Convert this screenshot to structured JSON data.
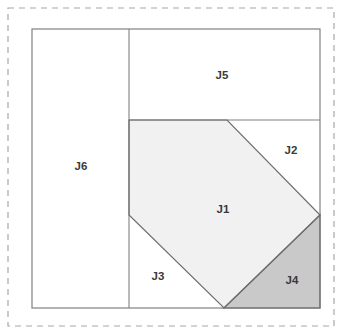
{
  "figure": {
    "canvas": {
      "width": 342,
      "height": 334,
      "background": "#ffffff"
    },
    "outer_dashed_frame": {
      "x": 8,
      "y": 8,
      "width": 326,
      "height": 318,
      "stroke": "#a8a8a8",
      "dash": "6 5"
    },
    "outer_square": {
      "x": 32,
      "y": 29,
      "width": 288,
      "height": 279,
      "stroke": "#808080",
      "fill": "#ffffff"
    },
    "colors": {
      "line": "#808080",
      "diagonal_line": "#6e6e6e",
      "label_text": "#3a3a3a",
      "fill_white": "#ffffff",
      "fill_light_gray": "#f1f1f1",
      "fill_medium_gray": "#c9c9c9",
      "dashed_frame": "#a8a8a8"
    },
    "dividers": [
      {
        "name": "vertical-divider",
        "x1": 129,
        "y1": 29,
        "x2": 129,
        "y2": 308
      },
      {
        "name": "horizontal-divider",
        "x1": 129,
        "y1": 120,
        "x2": 320,
        "y2": 120
      }
    ],
    "regions": [
      {
        "id": "J1",
        "label": "J1",
        "shape": "pentagon",
        "points": "129,120 227,120 320,215 224,308 129,215",
        "fill": "#f1f1f1",
        "label_x": 223,
        "label_y": 210
      },
      {
        "id": "J2",
        "label": "J2",
        "shape": "triangle",
        "points": "227,120 320,120 320,215",
        "fill": "#ffffff",
        "label_x": 291,
        "label_y": 151
      },
      {
        "id": "J3",
        "label": "J3",
        "shape": "triangle",
        "points": "129,215 224,308 129,308",
        "fill": "#ffffff",
        "label_x": 158,
        "label_y": 277
      },
      {
        "id": "J4",
        "label": "J4",
        "shape": "triangle",
        "points": "320,215 320,308 224,308",
        "fill": "#c9c9c9",
        "label_x": 292,
        "label_y": 281
      },
      {
        "id": "J5",
        "label": "J5",
        "shape": "rectangle",
        "points": "129,29 320,29 320,120 129,120",
        "fill": "#ffffff",
        "label_x": 222,
        "label_y": 76
      },
      {
        "id": "J6",
        "label": "J6",
        "shape": "rectangle",
        "points": "32,29 129,29 129,308 32,308",
        "fill": "#ffffff",
        "label_x": 81,
        "label_y": 167
      }
    ]
  }
}
